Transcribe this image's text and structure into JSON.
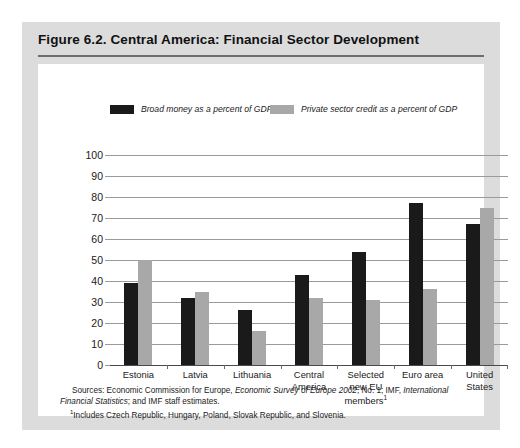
{
  "figure": {
    "title": "Figure 6.2.  Central America: Financial Sector Development"
  },
  "notes": {
    "sources_prefix": "Sources: Economic Commission for Europe, ",
    "sources_italic_1": "Economic Survey of Europe 2002",
    "sources_mid": ", No. 1; IMF, ",
    "sources_italic_2": "International Financial Statistics",
    "sources_suffix": "; and IMF staff estimates.",
    "footnote_marker": "1",
    "footnote_text": "Includes Czech Republic, Hungary, Poland, Slovak Republic, and Slovenia."
  },
  "colors": {
    "series_broad_money": "#1a1a1a",
    "series_private_credit": "#a8a8a8",
    "panel_background": "#dcdcdc",
    "card_background": "#ffffff",
    "gridline": "#9a9a9a",
    "axis": "#4a4a4a"
  },
  "chart_data": {
    "type": "bar",
    "title": "Figure 6.2.  Central America: Financial Sector Development",
    "xlabel": "",
    "ylabel": "",
    "ylim": [
      0,
      100
    ],
    "yticks": [
      0,
      10,
      20,
      30,
      40,
      50,
      60,
      70,
      80,
      90,
      100
    ],
    "ytick_labels": [
      "0",
      "10",
      "20",
      "30",
      "40",
      "50",
      "60",
      "70",
      "80",
      "90",
      "100"
    ],
    "grid": true,
    "legend_position": "top",
    "categories": [
      "Estonia",
      "Latvia",
      "Lithuania",
      "Central America",
      "Selected new EU members",
      "Euro area",
      "United States"
    ],
    "category_labels": [
      [
        "Estonia"
      ],
      [
        "Latvia"
      ],
      [
        "Lithuania"
      ],
      [
        "Central",
        "America"
      ],
      [
        "Selected",
        "new EU",
        "members"
      ],
      [
        "Euro area"
      ],
      [
        "United",
        "States"
      ]
    ],
    "category_footnote_index": 4,
    "series": [
      {
        "name": "Broad money as a percent of GDP",
        "color": "#1a1a1a",
        "values": [
          39,
          32,
          26,
          43,
          54,
          77,
          67
        ]
      },
      {
        "name": "Private sector credit as a percent of GDP",
        "color": "#a8a8a8",
        "values": [
          50,
          35,
          16,
          32,
          31,
          36,
          75
        ]
      }
    ]
  }
}
